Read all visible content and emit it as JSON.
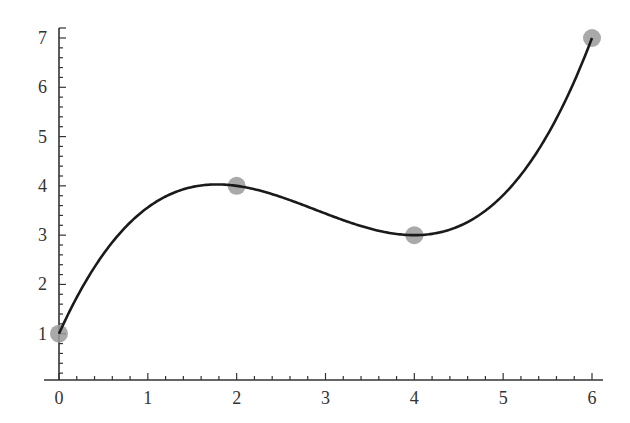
{
  "chart_data": {
    "type": "scatter",
    "title": "",
    "xlabel": "",
    "ylabel": "",
    "xlim": [
      0,
      6
    ],
    "ylim": [
      0,
      7
    ],
    "grid": false,
    "legend": null,
    "x_ticks": [
      "0",
      "1",
      "2",
      "3",
      "4",
      "5",
      "6"
    ],
    "y_ticks": [
      "1",
      "2",
      "3",
      "4",
      "5",
      "6",
      "7"
    ],
    "series": [
      {
        "name": "data points",
        "type": "scatter",
        "color": "#9a9a9a",
        "x": [
          0,
          2,
          4,
          6
        ],
        "y": [
          1,
          4,
          3,
          7
        ]
      },
      {
        "name": "interpolating cubic",
        "type": "line",
        "color": "#1a1a1a",
        "formula": "y = 1 + 3.5x - 1.25x^2 + 0.125x^3",
        "x": [
          0,
          0.5,
          1,
          1.5,
          2,
          2.5,
          3,
          3.5,
          4,
          4.5,
          5,
          5.5,
          6
        ],
        "y": [
          1,
          2.45,
          3.375,
          3.86,
          4,
          3.89,
          3.625,
          3.3,
          3,
          2.83,
          2.875,
          3.23,
          4
        ]
      }
    ]
  }
}
